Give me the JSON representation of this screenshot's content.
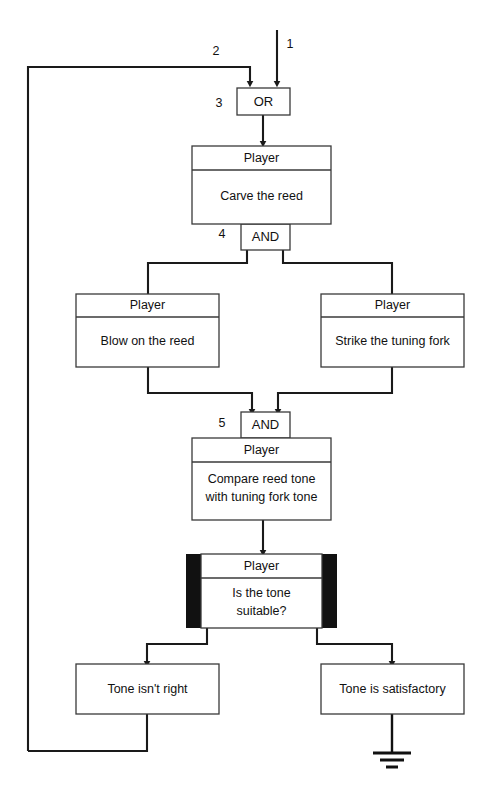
{
  "diagram": {
    "type": "flowchart",
    "colors": {
      "background": "#ffffff",
      "line": "#1a1a1a",
      "box_stroke": "#3a3a3a",
      "bar_fill": "#111111",
      "text": "#111111"
    },
    "step_numbers": [
      {
        "id": "num-1",
        "label": "1"
      },
      {
        "id": "num-2",
        "label": "2"
      },
      {
        "id": "num-3",
        "label": "3"
      },
      {
        "id": "num-4",
        "label": "4"
      },
      {
        "id": "num-5",
        "label": "5"
      }
    ],
    "gates": [
      {
        "id": "gate-or",
        "label": "OR"
      },
      {
        "id": "gate-and-1",
        "label": "AND"
      },
      {
        "id": "gate-and-2",
        "label": "AND"
      }
    ],
    "task_boxes": [
      {
        "id": "task-carve-the-reed",
        "header": "Player",
        "body": "Carve the reed"
      },
      {
        "id": "task-blow-on-the-reed",
        "header": "Player",
        "body": "Blow on the reed"
      },
      {
        "id": "task-strike-the-tuning-fork",
        "header": "Player",
        "body": "Strike the tuning fork"
      },
      {
        "id": "task-compare-reed-tone",
        "header": "Player",
        "body_line1": "Compare reed tone",
        "body_line2": "with tuning fork tone"
      }
    ],
    "decision_box": {
      "id": "decision-is-the-tone-suitable",
      "header": "Player",
      "body_line1": "Is the tone",
      "body_line2": "suitable?"
    },
    "outcome_boxes": [
      {
        "id": "outcome-tone-isnt-right",
        "label": "Tone isn't right"
      },
      {
        "id": "outcome-tone-is-satisfactory",
        "label": "Tone is satisfactory"
      }
    ],
    "terminator": {
      "id": "ground-symbol",
      "name": "ground-icon"
    }
  }
}
